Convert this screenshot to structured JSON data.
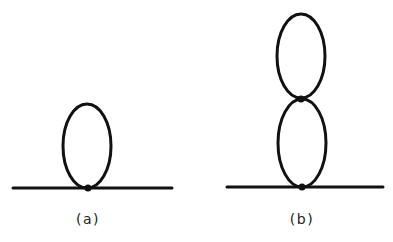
{
  "figure": {
    "panels": [
      {
        "id": "a",
        "label": "(a)",
        "description": "tadpole diagram: single loop attached to a propagator line at one vertex",
        "loops": 1,
        "vertices": 1
      },
      {
        "id": "b",
        "label": "(b)",
        "description": "double-scoop diagram: two stacked loops attached to a propagator line",
        "loops": 2,
        "vertices": 2
      }
    ],
    "colors": {
      "line": "#111111",
      "label": "#222222",
      "background": "#ffffff"
    }
  }
}
